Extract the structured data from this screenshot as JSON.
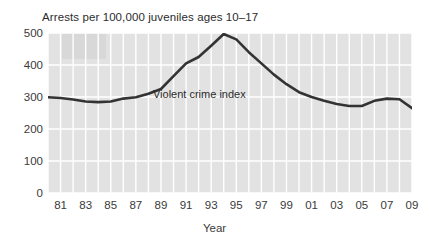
{
  "chart_data": {
    "type": "line",
    "title": "Arrests per 100,000 juveniles ages 10–17",
    "xlabel": "Year",
    "ylabel": "",
    "grid": true,
    "legend_position": "inline-annotation",
    "xlim": [
      1980,
      2009
    ],
    "ylim": [
      0,
      500
    ],
    "ytick_labels": [
      "0",
      "100",
      "200",
      "300",
      "400",
      "500"
    ],
    "yticks": [
      0,
      100,
      200,
      300,
      400,
      500
    ],
    "xtick_labels": [
      "81",
      "83",
      "85",
      "87",
      "89",
      "91",
      "93",
      "95",
      "97",
      "99",
      "01",
      "03",
      "05",
      "07",
      "09"
    ],
    "xticks": [
      1981,
      1983,
      1985,
      1987,
      1989,
      1991,
      1993,
      1995,
      1997,
      1999,
      2001,
      2003,
      2005,
      2007,
      2009
    ],
    "series": [
      {
        "name": "Violent crime index",
        "color": "#333333",
        "x": [
          1980,
          1981,
          1982,
          1983,
          1984,
          1985,
          1986,
          1987,
          1988,
          1989,
          1990,
          1991,
          1992,
          1993,
          1994,
          1995,
          1996,
          1997,
          1998,
          1999,
          2000,
          2001,
          2002,
          2003,
          2004,
          2005,
          2006,
          2007,
          2008,
          2009
        ],
        "values": [
          299,
          297,
          292,
          286,
          284,
          286,
          295,
          299,
          310,
          325,
          365,
          405,
          425,
          460,
          497,
          480,
          440,
          405,
          370,
          340,
          315,
          300,
          288,
          278,
          272,
          272,
          288,
          295,
          293,
          265
        ]
      }
    ],
    "annotations": [
      {
        "text": "Violent crime index",
        "x": 1989,
        "y": 305
      }
    ],
    "colors": {
      "plot_background": "#e2e2e2",
      "gridline": "#ffffff",
      "line": "#333333",
      "text": "#333333",
      "page_background": "#ffffff"
    }
  }
}
